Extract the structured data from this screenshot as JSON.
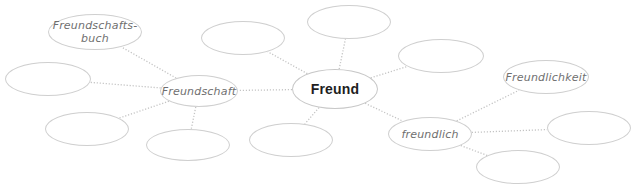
{
  "diagram": {
    "type": "word-web / mind-map",
    "center": {
      "id": "freund",
      "label": "Freund"
    },
    "nodes": [
      {
        "id": "freund",
        "label": "Freund",
        "cx": 335,
        "cy": 89,
        "rx": 43,
        "ry": 20,
        "center": true
      },
      {
        "id": "freundschaft",
        "label": "Freundschaft",
        "cx": 199,
        "cy": 91,
        "rx": 39,
        "ry": 16
      },
      {
        "id": "freundschaftsbuch",
        "label": "Freundschafts-\nbuch",
        "cx": 95,
        "cy": 32,
        "rx": 47,
        "ry": 18
      },
      {
        "id": "freundlich",
        "label": "freundlich",
        "cx": 430,
        "cy": 134,
        "rx": 42,
        "ry": 17
      },
      {
        "id": "freundlichkeit",
        "label": "Freundlichkeit",
        "cx": 546,
        "cy": 77,
        "rx": 43,
        "ry": 17
      },
      {
        "id": "blank-1",
        "label": "",
        "cx": 48,
        "cy": 79,
        "rx": 43,
        "ry": 17
      },
      {
        "id": "blank-2",
        "label": "",
        "cx": 87,
        "cy": 129,
        "rx": 42,
        "ry": 17
      },
      {
        "id": "blank-3",
        "label": "",
        "cx": 188,
        "cy": 145,
        "rx": 42,
        "ry": 16
      },
      {
        "id": "blank-4",
        "label": "",
        "cx": 243,
        "cy": 38,
        "rx": 42,
        "ry": 17
      },
      {
        "id": "blank-5",
        "label": "",
        "cx": 349,
        "cy": 22,
        "rx": 42,
        "ry": 17
      },
      {
        "id": "blank-6",
        "label": "",
        "cx": 291,
        "cy": 140,
        "rx": 42,
        "ry": 17
      },
      {
        "id": "blank-7",
        "label": "",
        "cx": 441,
        "cy": 56,
        "rx": 43,
        "ry": 17
      },
      {
        "id": "blank-8",
        "label": "",
        "cx": 589,
        "cy": 128,
        "rx": 42,
        "ry": 17
      },
      {
        "id": "blank-9",
        "label": "",
        "cx": 518,
        "cy": 167,
        "rx": 42,
        "ry": 17
      }
    ],
    "edges": [
      [
        "freund",
        "freundschaft"
      ],
      [
        "freund",
        "blank-4"
      ],
      [
        "freund",
        "blank-5"
      ],
      [
        "freund",
        "blank-7"
      ],
      [
        "freund",
        "blank-6"
      ],
      [
        "freund",
        "freundlich"
      ],
      [
        "freundschaft",
        "freundschaftsbuch"
      ],
      [
        "freundschaft",
        "blank-1"
      ],
      [
        "freundschaft",
        "blank-2"
      ],
      [
        "freundschaft",
        "blank-3"
      ],
      [
        "freundlich",
        "freundlichkeit"
      ],
      [
        "freundlich",
        "blank-8"
      ],
      [
        "freundlich",
        "blank-9"
      ]
    ],
    "colors": {
      "edge": "#c4c4c4",
      "node_border": "#cfcfcf",
      "label": "#6f6f6f",
      "center_label": "#1e1e1e"
    }
  }
}
